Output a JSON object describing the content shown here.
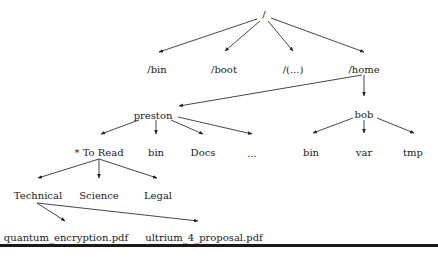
{
  "diagram": {
    "type": "directory-tree",
    "nodes": [
      {
        "id": "root",
        "label": "/",
        "x": 264,
        "y": 15
      },
      {
        "id": "bin",
        "label": "/bin",
        "x": 157,
        "y": 70
      },
      {
        "id": "boot",
        "label": "/boot",
        "x": 224,
        "y": 70
      },
      {
        "id": "etc",
        "label": "/(...)",
        "x": 293,
        "y": 70
      },
      {
        "id": "home",
        "label": "/home",
        "x": 364,
        "y": 70
      },
      {
        "id": "preston",
        "label": "preston",
        "x": 153,
        "y": 116
      },
      {
        "id": "bob",
        "label": "bob",
        "x": 364,
        "y": 115
      },
      {
        "id": "toread",
        "label": "* To Read",
        "x": 99,
        "y": 153
      },
      {
        "id": "pbin",
        "label": "bin",
        "x": 156,
        "y": 153
      },
      {
        "id": "docs",
        "label": "Docs",
        "x": 203,
        "y": 153
      },
      {
        "id": "more",
        "label": "...",
        "x": 252,
        "y": 154
      },
      {
        "id": "bbin",
        "label": "bin",
        "x": 311,
        "y": 153
      },
      {
        "id": "var",
        "label": "var",
        "x": 364,
        "y": 153
      },
      {
        "id": "tmp",
        "label": "tmp",
        "x": 413,
        "y": 153
      },
      {
        "id": "technical",
        "label": "Technical",
        "x": 38,
        "y": 196
      },
      {
        "id": "science",
        "label": "Science",
        "x": 99,
        "y": 196
      },
      {
        "id": "legal",
        "label": "Legal",
        "x": 158,
        "y": 196
      },
      {
        "id": "qe",
        "label": "quantum_encryption.pdf",
        "x": 66,
        "y": 238
      },
      {
        "id": "u4",
        "label": "ultrium_4_proposal.pdf",
        "x": 204,
        "y": 238
      }
    ],
    "edges": [
      {
        "from": "root",
        "to": "bin",
        "x1": 257,
        "y1": 19,
        "x2": 159,
        "y2": 52
      },
      {
        "from": "root",
        "to": "boot",
        "x1": 260,
        "y1": 21,
        "x2": 225,
        "y2": 51
      },
      {
        "from": "root",
        "to": "etc",
        "x1": 268,
        "y1": 21,
        "x2": 293,
        "y2": 51
      },
      {
        "from": "root",
        "to": "home",
        "x1": 271,
        "y1": 18,
        "x2": 364,
        "y2": 52
      },
      {
        "from": "home",
        "to": "preston",
        "x1": 362,
        "y1": 75,
        "x2": 179,
        "y2": 106
      },
      {
        "from": "home",
        "to": "bob",
        "x1": 364,
        "y1": 75,
        "x2": 364,
        "y2": 96
      },
      {
        "from": "preston",
        "to": "toread",
        "x1": 139,
        "y1": 120,
        "x2": 101,
        "y2": 134
      },
      {
        "from": "preston",
        "to": "pbin",
        "x1": 156,
        "y1": 120,
        "x2": 156,
        "y2": 134
      },
      {
        "from": "preston",
        "to": "docs",
        "x1": 171,
        "y1": 120,
        "x2": 203,
        "y2": 134
      },
      {
        "from": "preston",
        "to": "more",
        "x1": 178,
        "y1": 117,
        "x2": 252,
        "y2": 134
      },
      {
        "from": "bob",
        "to": "bbin",
        "x1": 353,
        "y1": 118,
        "x2": 313,
        "y2": 133
      },
      {
        "from": "bob",
        "to": "var",
        "x1": 364,
        "y1": 120,
        "x2": 364,
        "y2": 133
      },
      {
        "from": "bob",
        "to": "tmp",
        "x1": 377,
        "y1": 118,
        "x2": 414,
        "y2": 133
      },
      {
        "from": "toread",
        "to": "technical",
        "x1": 99,
        "y1": 159,
        "x2": 38,
        "y2": 178
      },
      {
        "from": "toread",
        "to": "science",
        "x1": 99,
        "y1": 159,
        "x2": 99,
        "y2": 178
      },
      {
        "from": "toread",
        "to": "legal",
        "x1": 99,
        "y1": 159,
        "x2": 157,
        "y2": 178
      },
      {
        "from": "technical",
        "to": "qe",
        "x1": 37,
        "y1": 203,
        "x2": 65,
        "y2": 221
      },
      {
        "from": "technical",
        "to": "u4",
        "x1": 37,
        "y1": 203,
        "x2": 198,
        "y2": 221
      }
    ]
  },
  "style": {
    "line_color": "#333333",
    "text_color": "#1a1a1a",
    "rule_color": "#1a1a1a"
  }
}
